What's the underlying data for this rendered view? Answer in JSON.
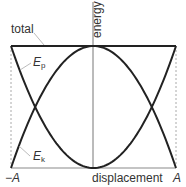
{
  "chart_data": {
    "type": "line",
    "title": "",
    "xlabel": "displacement",
    "ylabel": "energy",
    "x_ticks": [
      "−A",
      "A"
    ],
    "xlim": [
      -1,
      1
    ],
    "ylim": [
      0,
      1
    ],
    "grid": false,
    "series": [
      {
        "name": "total",
        "label": "total",
        "formula": "E = 1",
        "x": [
          -1,
          0,
          1
        ],
        "y": [
          1,
          1,
          1
        ]
      },
      {
        "name": "Ep",
        "label_main": "E",
        "label_sub": "p",
        "formula": "Ep = x^2",
        "x": [
          -1,
          -0.707,
          -0.5,
          0,
          0.5,
          0.707,
          1
        ],
        "y": [
          1,
          0.5,
          0.25,
          0,
          0.25,
          0.5,
          1
        ]
      },
      {
        "name": "Ek",
        "label_main": "E",
        "label_sub": "k",
        "formula": "Ek = 1 - x^2",
        "x": [
          -1,
          -0.707,
          -0.5,
          0,
          0.5,
          0.707,
          1
        ],
        "y": [
          0,
          0.5,
          0.75,
          1,
          0.75,
          0.5,
          0
        ]
      }
    ],
    "colors": {
      "curves": "#222222",
      "axis": "#aaaaaa",
      "dashed": "#aaaaaa",
      "text": "#333333"
    }
  }
}
